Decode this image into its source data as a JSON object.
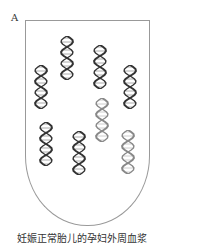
{
  "panel_label": "A",
  "caption": "妊娠正常胎儿的孕妇外周血浆",
  "colors": {
    "dark_dna": "#333333",
    "light_dna": "#888888",
    "outline": "#999999"
  },
  "helices": [
    {
      "x": 60,
      "y": 36,
      "shade": "dark"
    },
    {
      "x": 93,
      "y": 45,
      "shade": "dark"
    },
    {
      "x": 34,
      "y": 65,
      "shade": "dark"
    },
    {
      "x": 123,
      "y": 65,
      "shade": "dark"
    },
    {
      "x": 95,
      "y": 98,
      "shade": "light"
    },
    {
      "x": 39,
      "y": 122,
      "shade": "dark"
    },
    {
      "x": 72,
      "y": 131,
      "shade": "dark"
    },
    {
      "x": 121,
      "y": 130,
      "shade": "light"
    }
  ]
}
